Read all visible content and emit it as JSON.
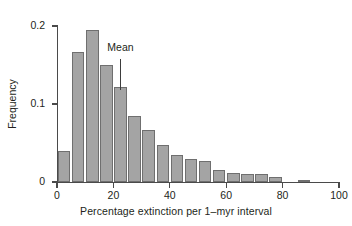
{
  "chart_data": {
    "type": "bar",
    "title": "",
    "subtitle": "",
    "xlabel": "Percentage extinction per 1–myr interval",
    "ylabel": "Frequency",
    "xlim": [
      0,
      100
    ],
    "ylim": [
      0,
      0.2
    ],
    "grid": false,
    "legend": null,
    "bin_width": 5,
    "bar_color": "#a4a4a4",
    "bar_edge_color": "#6f6f6f",
    "axis_color": "#4a4a4a",
    "text_color": "#231f20",
    "background_color": "#ffffff",
    "xticks": [
      0,
      20,
      40,
      60,
      80,
      100
    ],
    "xtick_labels": [
      "0",
      "20",
      "40",
      "60",
      "80",
      "100"
    ],
    "yticks": [
      0,
      0.1,
      0.2
    ],
    "ytick_labels": [
      "0",
      "0.1",
      "0.2"
    ],
    "categories": [
      "0-5",
      "5-10",
      "10-15",
      "15-20",
      "20-25",
      "25-30",
      "30-35",
      "35-40",
      "40-45",
      "45-50",
      "50-55",
      "55-60",
      "60-65",
      "65-70",
      "70-75",
      "75-80",
      "80-85",
      "85-90",
      "90-95",
      "95-100"
    ],
    "bin_starts": [
      0,
      5,
      10,
      15,
      20,
      25,
      30,
      35,
      40,
      45,
      50,
      55,
      60,
      65,
      70,
      75,
      80,
      85,
      90,
      95
    ],
    "values": [
      0.04,
      0.167,
      0.195,
      0.15,
      0.122,
      0.085,
      0.067,
      0.048,
      0.035,
      0.03,
      0.027,
      0.016,
      0.011,
      0.01,
      0.01,
      0.006,
      0.0,
      0.003,
      0.0,
      0.0
    ],
    "annotations": [
      {
        "name": "mean",
        "label": "Mean",
        "x": 22.5,
        "label_y": 0.172,
        "pointer_top": 0.158,
        "pointer_bottom": 0.118
      }
    ]
  }
}
